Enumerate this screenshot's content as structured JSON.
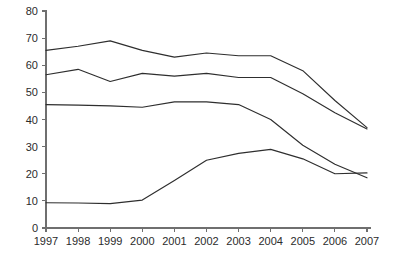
{
  "chart_data": {
    "type": "line",
    "title": "",
    "subtitle": "",
    "xlabel": "",
    "ylabel": "",
    "categories": [
      "1997",
      "1998",
      "1999",
      "2000",
      "2001",
      "2002",
      "2003",
      "2004",
      "2005",
      "2006",
      "2007"
    ],
    "x": [
      1997,
      1998,
      1999,
      2000,
      2001,
      2002,
      2003,
      2004,
      2005,
      2006,
      2007
    ],
    "xlim": [
      1997,
      2007
    ],
    "ylim": [
      0,
      80
    ],
    "yticks": [
      0,
      10,
      20,
      30,
      40,
      50,
      60,
      70,
      80
    ],
    "ytick_labels": [
      "0",
      "10",
      "20",
      "30",
      "40",
      "50",
      "60",
      "70",
      "80"
    ],
    "xtick_labels": [
      "1997",
      "1998",
      "1999",
      "2000",
      "2001",
      "2002",
      "2003",
      "2004",
      "2005",
      "2006",
      "2007"
    ],
    "grid": false,
    "legend": false,
    "legend_position": "none",
    "line_color": "#2e2e2e",
    "axis_color": "#6f6f6f",
    "background_color": "#ffffff",
    "series": [
      {
        "name": "Series 1",
        "values": [
          65.5,
          67.0,
          69.0,
          65.5,
          63.0,
          64.5,
          63.5,
          63.5,
          58.0,
          47.0,
          37.0
        ]
      },
      {
        "name": "Series 2",
        "values": [
          56.5,
          58.5,
          54.0,
          57.0,
          56.0,
          57.0,
          55.5,
          55.5,
          49.5,
          42.5,
          36.5
        ]
      },
      {
        "name": "Series 3",
        "values": [
          45.5,
          45.3,
          45.0,
          44.5,
          46.5,
          46.5,
          45.5,
          40.0,
          30.5,
          23.5,
          18.5
        ]
      },
      {
        "name": "Series 4",
        "values": [
          9.3,
          9.2,
          9.0,
          10.3,
          17.5,
          25.0,
          27.5,
          29.0,
          25.5,
          20.0,
          20.3
        ]
      }
    ]
  },
  "plot_geometry": {
    "left": 46,
    "right": 367,
    "top": 11,
    "bottom": 228
  }
}
